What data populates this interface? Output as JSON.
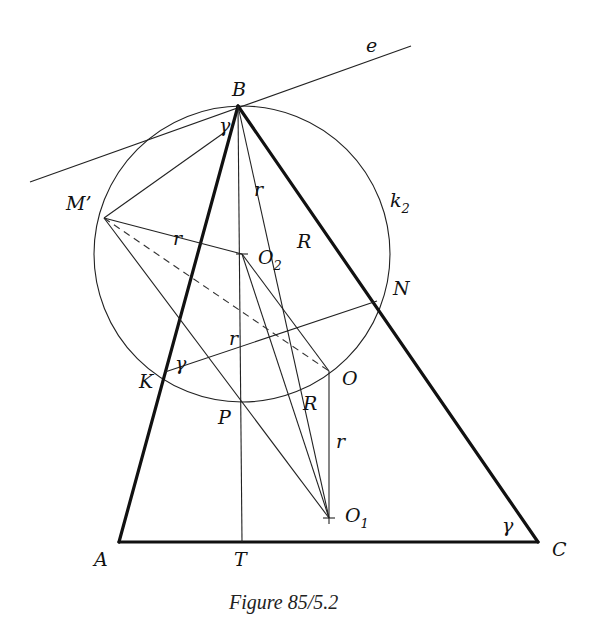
{
  "figure": {
    "caption": "Figure 85/5.2",
    "type": "geometry-diagram"
  },
  "points": {
    "A": {
      "label": "A",
      "x": 119,
      "y": 542
    },
    "B": {
      "label": "B",
      "x": 238,
      "y": 106
    },
    "C": {
      "label": "C",
      "x": 538,
      "y": 542
    },
    "T": {
      "label": "T",
      "x": 242,
      "y": 542
    },
    "M_prime": {
      "label": "M’",
      "x": 104,
      "y": 218
    },
    "O2": {
      "label": "O",
      "sub": "2",
      "x": 242,
      "y": 254
    },
    "O": {
      "label": "O",
      "x": 329,
      "y": 371
    },
    "O1": {
      "label": "O",
      "sub": "1",
      "x": 329,
      "y": 518
    },
    "K": {
      "label": "K",
      "x": 165,
      "y": 372
    },
    "N": {
      "label": "N",
      "x": 377,
      "y": 301
    },
    "P": {
      "label": "P",
      "x": 242,
      "y": 400
    }
  },
  "circle": {
    "name": "k",
    "sub": "2",
    "center": "O2",
    "radius": 148
  },
  "tangent_line": {
    "label": "e"
  },
  "segment_labels": {
    "r_BO2": "r",
    "r_MO2": "r",
    "r_O2P": "r",
    "r_OO1": "r",
    "R_BO": "R",
    "R_OO1side": "R"
  },
  "angle_labels": {
    "at_B": "γ",
    "at_K": "γ",
    "at_C": "γ"
  }
}
